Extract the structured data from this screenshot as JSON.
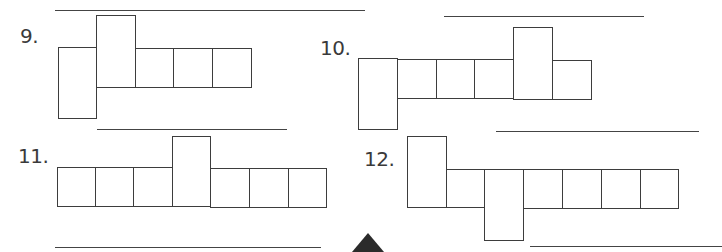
{
  "problems": [
    {
      "number": "9.",
      "label_text": "9."
    },
    {
      "number": "10.",
      "label_text": "10."
    },
    {
      "number": "11.",
      "label_text": "11."
    },
    {
      "number": "12.",
      "label_text": "12."
    }
  ],
  "answer_lines_count": 8,
  "figure_description": "Nets of rectangular prisms made of square and rectangular faces with blank answer lines",
  "colors": {
    "stroke": "#3d3d3d",
    "background": "#ffffff",
    "marker": "#2b2b2b"
  }
}
